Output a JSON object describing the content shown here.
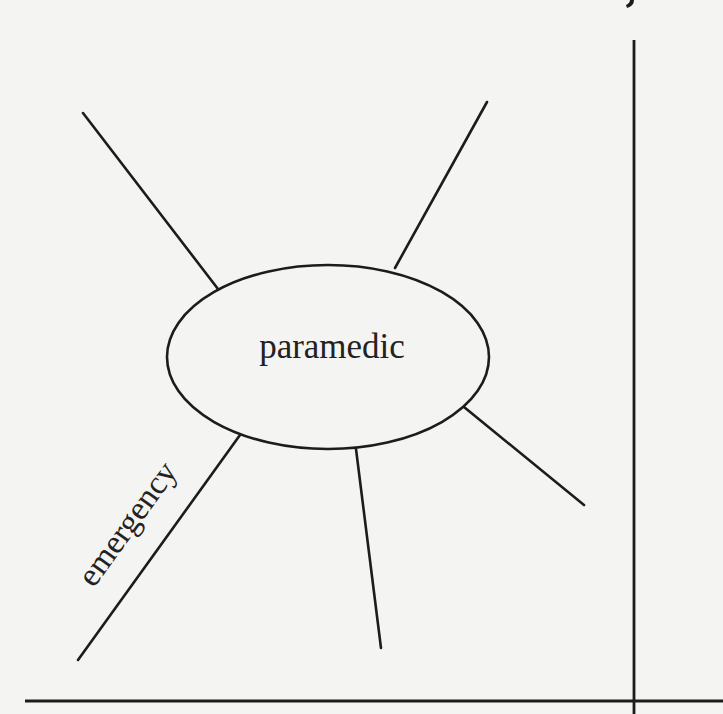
{
  "diagram": {
    "type": "word-web",
    "center": {
      "label": "paramedic",
      "cx": 328,
      "cy": 357,
      "rx": 161,
      "ry": 92
    },
    "spokes": [
      {
        "id": "top-left",
        "x1": 83,
        "y1": 113,
        "x2": 218,
        "y2": 289,
        "label": ""
      },
      {
        "id": "top-right",
        "x1": 487,
        "y1": 102,
        "x2": 395,
        "y2": 268,
        "label": ""
      },
      {
        "id": "lower-right",
        "x1": 464,
        "y1": 407,
        "x2": 584,
        "y2": 505,
        "label": ""
      },
      {
        "id": "bottom",
        "x1": 356,
        "y1": 449,
        "x2": 381,
        "y2": 648,
        "label": ""
      },
      {
        "id": "bottom-left",
        "x1": 240,
        "y1": 435,
        "x2": 78,
        "y2": 660,
        "label": "emergency"
      }
    ],
    "frame": {
      "vertical_line": {
        "x": 634,
        "y1": 40,
        "y2": 714
      },
      "horizontal_line": {
        "y": 701,
        "x1": 25,
        "x2": 723
      }
    },
    "colors": {
      "ink": "#1c1c1c",
      "paper": "#f4f4f2"
    }
  }
}
